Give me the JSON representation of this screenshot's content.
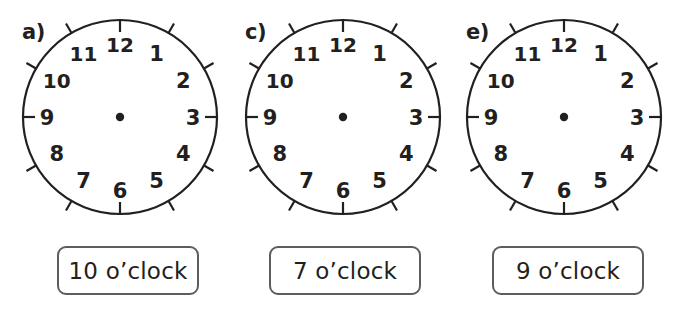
{
  "page": {
    "background_color": "#ffffff",
    "ink_color": "#231f20",
    "box_border_color": "#5d5d5d"
  },
  "clock_face": {
    "hour_numerals": [
      "12",
      "1",
      "2",
      "3",
      "4",
      "5",
      "6",
      "7",
      "8",
      "9",
      "10",
      "11"
    ],
    "tick_count": 12,
    "has_center_dot": true,
    "has_hands": false,
    "dial_color": "#ffffff",
    "outline_color": "#231f20"
  },
  "items": [
    {
      "letter": "a)",
      "clock": {
        "name": "clock-face-a",
        "hour_numerals": [
          "12",
          "1",
          "2",
          "3",
          "4",
          "5",
          "6",
          "7",
          "8",
          "9",
          "10",
          "11"
        ],
        "hands_shown": "none"
      },
      "answer": {
        "name": "answer-box-a",
        "text": "10 o’clock",
        "hour": "10"
      }
    },
    {
      "letter": "c)",
      "clock": {
        "name": "clock-face-c",
        "hour_numerals": [
          "12",
          "1",
          "2",
          "3",
          "4",
          "5",
          "6",
          "7",
          "8",
          "9",
          "10",
          "11"
        ],
        "hands_shown": "none"
      },
      "answer": {
        "name": "answer-box-c",
        "text": "7 o’clock",
        "hour": "7"
      }
    },
    {
      "letter": "e)",
      "clock": {
        "name": "clock-face-e",
        "hour_numerals": [
          "12",
          "1",
          "2",
          "3",
          "4",
          "5",
          "6",
          "7",
          "8",
          "9",
          "10",
          "11"
        ],
        "hands_shown": "none"
      },
      "answer": {
        "name": "answer-box-e",
        "text": "9 o’clock",
        "hour": "9"
      }
    }
  ]
}
